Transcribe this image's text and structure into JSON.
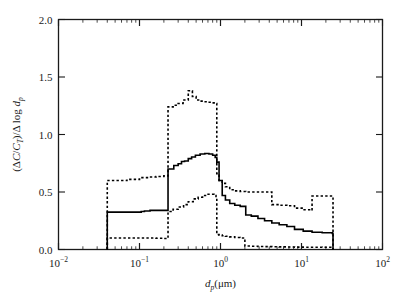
{
  "figure": {
    "background_color": "#ffffff",
    "frame_color": "#1a1a1a"
  },
  "axes": {
    "x": {
      "title_main": "d",
      "title_sub": "p",
      "title_unit": "(μm)",
      "scale": "log",
      "min": 0.01,
      "max": 100,
      "tick_labels": [
        "10",
        "10",
        "10",
        "10",
        "10"
      ],
      "tick_exponents": [
        "−2",
        "−1",
        "0",
        "1",
        "2"
      ],
      "tick_values": [
        0.01,
        0.1,
        1,
        10,
        100
      ]
    },
    "y": {
      "title_open": "(",
      "title_delta1": "Δ",
      "title_c": "C",
      "title_slash1": "/",
      "title_ct": "C",
      "title_ct_sub": "T",
      "title_close": ")/",
      "title_delta2": "Δ",
      "title_log": " log ",
      "title_dp": "d",
      "title_dp_sub": "p",
      "full_label": "(ΔC/C_T)/Δ log d_p",
      "scale": "linear",
      "min": 0.0,
      "max": 2.0,
      "tick_labels": [
        "0.0",
        "0.5",
        "1.0",
        "1.5",
        "2.0"
      ],
      "tick_values": [
        0.0,
        0.5,
        1.0,
        1.5,
        2.0
      ]
    }
  },
  "chart_data": {
    "type": "line",
    "title": "",
    "xlabel": "d_p (μm)",
    "ylabel": "(ΔC/C_T)/Δ log d_p",
    "xscale": "log",
    "yscale": "linear",
    "xlim": [
      0.01,
      100
    ],
    "ylim": [
      0.0,
      2.0
    ],
    "grid": false,
    "legend": "none",
    "series": [
      {
        "name": "median",
        "style": "solid",
        "color": "#000000",
        "linewidth": 1.6,
        "step_type": "post",
        "x": [
          0.04,
          0.04,
          0.075,
          0.105,
          0.115,
          0.135,
          0.185,
          0.225,
          0.225,
          0.265,
          0.3,
          0.33,
          0.36,
          0.4,
          0.44,
          0.49,
          0.56,
          0.64,
          0.72,
          0.8,
          0.86,
          0.9,
          0.96,
          1.05,
          1.15,
          1.3,
          1.5,
          1.75,
          2.05,
          2.4,
          2.9,
          3.5,
          4.3,
          5.3,
          6.6,
          8.2,
          10.5,
          13.5,
          18.0,
          24.0,
          24.5
        ],
        "y": [
          0.0,
          0.325,
          0.325,
          0.33,
          0.335,
          0.34,
          0.34,
          0.34,
          0.7,
          0.73,
          0.745,
          0.765,
          0.77,
          0.79,
          0.805,
          0.82,
          0.83,
          0.835,
          0.83,
          0.82,
          0.8,
          0.76,
          0.6,
          0.47,
          0.43,
          0.4,
          0.385,
          0.375,
          0.3,
          0.29,
          0.27,
          0.25,
          0.23,
          0.215,
          0.2,
          0.175,
          0.16,
          0.15,
          0.145,
          0.14,
          0.0
        ]
      },
      {
        "name": "upper-bound",
        "style": "dashed",
        "color": "#000000",
        "linewidth": 1.6,
        "step_type": "post",
        "x": [
          0.04,
          0.04,
          0.07,
          0.1,
          0.13,
          0.16,
          0.2,
          0.225,
          0.225,
          0.26,
          0.3,
          0.345,
          0.4,
          0.45,
          0.5,
          0.56,
          0.62,
          0.7,
          0.79,
          0.86,
          0.9,
          0.9,
          0.96,
          1.05,
          1.15,
          1.3,
          1.5,
          1.75,
          2.05,
          2.4,
          2.9,
          3.5,
          4.3,
          4.3,
          5.3,
          6.6,
          8.2,
          10.5,
          13.5,
          13.5,
          18.0,
          24.0,
          24.5
        ],
        "y": [
          0.0,
          0.6,
          0.61,
          0.625,
          0.63,
          0.635,
          0.64,
          0.64,
          1.24,
          1.255,
          1.27,
          1.3,
          1.38,
          1.33,
          1.3,
          1.29,
          1.285,
          1.28,
          1.275,
          1.27,
          1.265,
          0.66,
          0.6,
          0.575,
          0.545,
          0.52,
          0.51,
          0.505,
          0.5,
          0.5,
          0.5,
          0.5,
          0.5,
          0.39,
          0.385,
          0.38,
          0.36,
          0.345,
          0.34,
          0.465,
          0.465,
          0.46,
          0.0
        ]
      },
      {
        "name": "lower-bound",
        "style": "dashed",
        "color": "#000000",
        "linewidth": 1.6,
        "step_type": "post",
        "x": [
          0.04,
          0.04,
          0.08,
          0.12,
          0.16,
          0.2,
          0.225,
          0.225,
          0.26,
          0.3,
          0.35,
          0.4,
          0.46,
          0.53,
          0.6,
          0.68,
          0.76,
          0.83,
          0.88,
          0.9,
          0.9,
          0.96,
          1.05,
          1.15,
          1.3,
          1.5,
          1.75,
          2.0,
          2.0,
          2.4,
          2.9,
          3.5,
          4.3,
          5.3,
          6.6,
          8.2,
          10.5,
          13.5,
          18.0,
          24.0,
          24.5
        ],
        "y": [
          0.0,
          0.1,
          0.1,
          0.1,
          0.098,
          0.095,
          0.095,
          0.33,
          0.35,
          0.37,
          0.39,
          0.415,
          0.44,
          0.455,
          0.47,
          0.48,
          0.48,
          0.47,
          0.45,
          0.43,
          0.13,
          0.125,
          0.12,
          0.115,
          0.11,
          0.105,
          0.1,
          0.095,
          0.03,
          0.028,
          0.026,
          0.025,
          0.024,
          0.023,
          0.022,
          0.021,
          0.02,
          0.02,
          0.019,
          0.018,
          0.0
        ]
      }
    ]
  }
}
